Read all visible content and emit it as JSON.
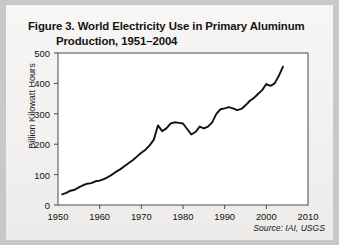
{
  "figure": {
    "title_line1": "Figure 3. World Electricity Use in Primary Aluminum",
    "title_line2": "Production, 1951–2004",
    "source_note": "Source: IAI, USGS"
  },
  "colors": {
    "line": "#111111",
    "axis": "#444444",
    "page": "#f4f3f1",
    "text": "#121212"
  },
  "chart_data": {
    "type": "line",
    "title": "Figure 3. World Electricity Use in Primary Aluminum Production, 1951–2004",
    "xlabel": "",
    "ylabel": "Billion Kilowatt Hours",
    "xlim": [
      1950,
      2010
    ],
    "ylim": [
      0,
      500
    ],
    "xticks": [
      1950,
      1960,
      1970,
      1980,
      1990,
      2000,
      2010
    ],
    "yticks": [
      0,
      100,
      200,
      300,
      400,
      500
    ],
    "grid": false,
    "legend": "none",
    "annotations": [
      "Source: IAI, USGS"
    ],
    "series": [
      {
        "name": "World electricity use in primary aluminum production",
        "units": "billion kilowatt-hours",
        "x": [
          1951,
          1952,
          1953,
          1954,
          1955,
          1956,
          1957,
          1958,
          1959,
          1960,
          1961,
          1962,
          1963,
          1964,
          1965,
          1966,
          1967,
          1968,
          1969,
          1970,
          1971,
          1972,
          1973,
          1974,
          1975,
          1976,
          1977,
          1978,
          1979,
          1980,
          1981,
          1982,
          1983,
          1984,
          1985,
          1986,
          1987,
          1988,
          1989,
          1990,
          1991,
          1992,
          1993,
          1994,
          1995,
          1996,
          1997,
          1998,
          1999,
          2000,
          2001,
          2002,
          2003,
          2004
        ],
        "values": [
          35,
          40,
          47,
          50,
          58,
          65,
          70,
          72,
          78,
          80,
          85,
          92,
          100,
          110,
          118,
          128,
          138,
          148,
          160,
          172,
          182,
          196,
          215,
          262,
          243,
          252,
          268,
          272,
          270,
          268,
          250,
          232,
          240,
          258,
          252,
          258,
          272,
          300,
          315,
          318,
          322,
          318,
          312,
          316,
          328,
          342,
          352,
          365,
          378,
          398,
          392,
          400,
          425,
          455
        ]
      }
    ]
  }
}
